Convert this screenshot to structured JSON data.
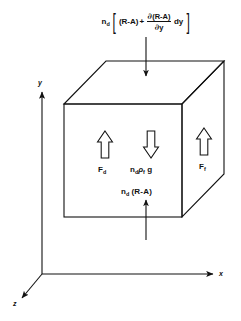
{
  "figure": {
    "background_color": "#ffffff",
    "line_color": "#111111",
    "top_flux": {
      "prefix": "n",
      "prefix_sub": "d",
      "bracket_open": "[",
      "term1": "(R-A)",
      "plus": "+",
      "fraction_numerator_partial": "∂",
      "fraction_numerator_body": "(R-A)",
      "fraction_denominator_partial": "∂",
      "fraction_denominator_body": "y",
      "differential": "dy",
      "bracket_close": "]",
      "arrow_direction": "down"
    },
    "bottom_flux": {
      "text": "n",
      "sub": "d",
      "body": "(R-A)",
      "arrow_direction": "up"
    },
    "forces": [
      {
        "name": "drag-force",
        "symbol": "F",
        "sub": "d",
        "arrow_direction": "up",
        "face": "front-left"
      },
      {
        "name": "gravity-force",
        "symbol": "n",
        "sub": "d",
        "symbol2": "ρ",
        "sub2": "f",
        "symbol3": "g",
        "arrow_direction": "down",
        "face": "front-center"
      },
      {
        "name": "fluid-force",
        "symbol": "F",
        "sub": "f",
        "arrow_direction": "up",
        "face": "right-side"
      }
    ],
    "axes": [
      {
        "name": "y-axis",
        "label": "y",
        "direction": "up"
      },
      {
        "name": "x-axis",
        "label": "x",
        "direction": "right"
      },
      {
        "name": "z-axis",
        "label": "z",
        "direction": "down-left"
      }
    ]
  }
}
